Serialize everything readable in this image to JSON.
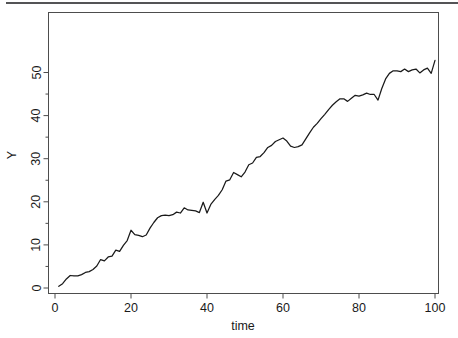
{
  "figure": {
    "background": "#ffffff",
    "line_color": "#1a1a1a",
    "axis_color": "#4d4d4d",
    "top_rule_color": "#545456"
  },
  "chart_data": {
    "type": "line",
    "title": "",
    "subtitle": "",
    "xlabel": "time",
    "ylabel": "Y",
    "xlim": [
      0,
      101
    ],
    "ylim": [
      -1.2,
      54
    ],
    "grid": false,
    "legend": null,
    "xticks": [
      0,
      20,
      40,
      60,
      80,
      100
    ],
    "xtick_labels": [
      "0",
      "20",
      "40",
      "60",
      "80",
      "100"
    ],
    "yticks": [
      0,
      10,
      20,
      30,
      40,
      50
    ],
    "ytick_labels": [
      "0",
      "10",
      "20",
      "30",
      "40",
      "50"
    ],
    "xminor_step": 5,
    "yminor_step": 5,
    "series": [
      {
        "name": "Y",
        "x": [
          1,
          2,
          3,
          4,
          5,
          6,
          7,
          8,
          9,
          10,
          11,
          12,
          13,
          14,
          15,
          16,
          17,
          18,
          19,
          20,
          21,
          22,
          23,
          24,
          25,
          26,
          27,
          28,
          29,
          30,
          31,
          32,
          33,
          34,
          35,
          36,
          37,
          38,
          39,
          40,
          41,
          42,
          43,
          44,
          45,
          46,
          47,
          48,
          49,
          50,
          51,
          52,
          53,
          54,
          55,
          56,
          57,
          58,
          59,
          60,
          61,
          62,
          63,
          64,
          65,
          66,
          67,
          68,
          69,
          70,
          71,
          72,
          73,
          74,
          75,
          76,
          77,
          78,
          79,
          80,
          81,
          82,
          83,
          84,
          85,
          86,
          87,
          88,
          89,
          90,
          91,
          92,
          93,
          94,
          95,
          96,
          97,
          98,
          99,
          100
        ],
        "values": [
          0.4,
          1.0,
          2.1,
          2.9,
          2.8,
          2.8,
          3.1,
          3.6,
          3.8,
          4.3,
          5.1,
          6.6,
          6.3,
          7.2,
          7.4,
          8.8,
          8.5,
          9.9,
          11.0,
          13.4,
          12.4,
          12.2,
          11.9,
          12.3,
          13.9,
          15.2,
          16.3,
          16.8,
          16.9,
          16.8,
          17.0,
          17.6,
          17.4,
          18.6,
          18.1,
          18.0,
          17.9,
          17.5,
          19.9,
          17.4,
          19.4,
          20.5,
          21.5,
          22.8,
          24.8,
          25.1,
          26.8,
          26.3,
          25.8,
          26.9,
          28.6,
          29.0,
          30.3,
          30.5,
          31.4,
          32.6,
          33.1,
          34.0,
          34.4,
          34.8,
          34.1,
          32.9,
          32.6,
          32.8,
          33.2,
          34.6,
          36.0,
          37.3,
          38.2,
          39.3,
          40.3,
          41.4,
          42.4,
          43.2,
          43.9,
          43.9,
          43.3,
          44.0,
          44.7,
          44.5,
          44.8,
          45.2,
          44.9,
          44.9,
          43.6,
          46.3,
          48.5,
          49.8,
          50.4,
          50.4,
          50.2,
          50.8,
          50.2,
          50.6,
          50.8,
          49.9,
          50.6,
          51.0,
          49.8,
          52.8
        ]
      }
    ]
  }
}
